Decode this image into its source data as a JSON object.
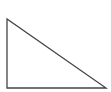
{
  "diagram": {
    "shape": "right-triangle",
    "stroke_color": "#444444",
    "fill_color": "#ffffff",
    "vertices": [
      [
        7,
        19
      ],
      [
        7,
        88
      ],
      [
        106,
        88
      ]
    ]
  }
}
